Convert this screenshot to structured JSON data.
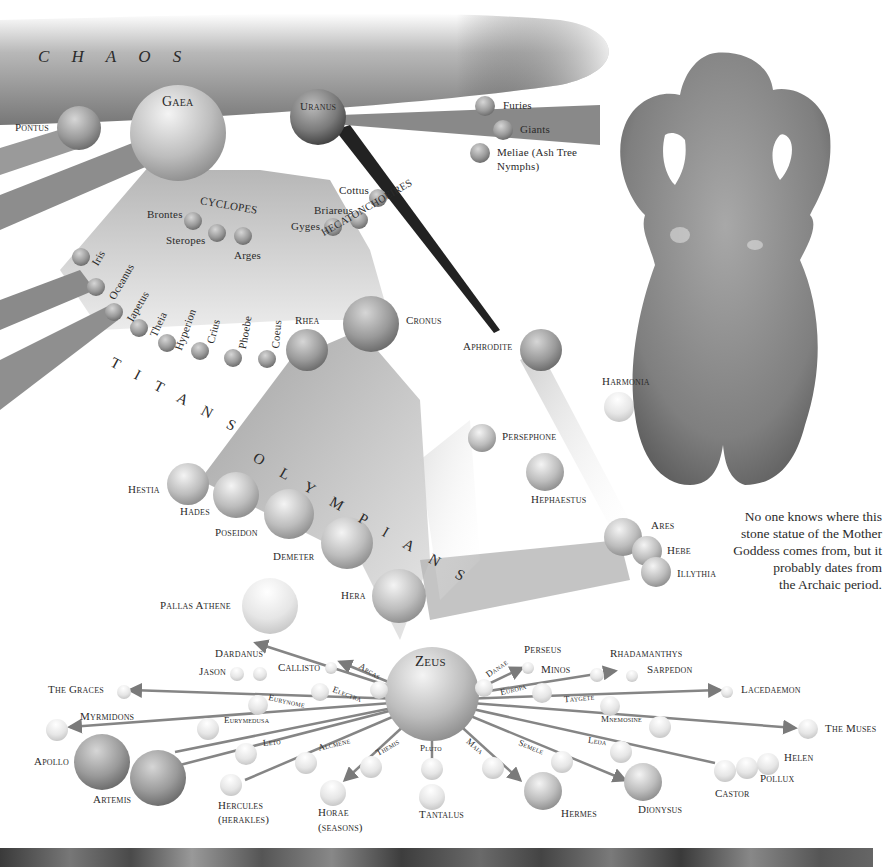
{
  "diagram": {
    "groups": {
      "chaos": "C   H   A   O   S",
      "cyclopes": "CYCLOPES",
      "hecatoncheires": "HECATONCHOEIRES",
      "titans": "T  I  T  A  N  S",
      "olympians": "O  L  Y  M  P  I  A  N  S"
    },
    "primordials": {
      "gaea": "Gaea",
      "uranus": "Uranus",
      "pontus": "Pontus"
    },
    "uranus_children": [
      "Furies",
      "Giants",
      "Meliae (Ash Tree",
      "Nymphs)"
    ],
    "cyclopes": [
      "Brontes",
      "Steropes",
      "Arges"
    ],
    "hecatoncheires": [
      "Cottus",
      "Briareus",
      "Gyges"
    ],
    "titans": [
      "Iris",
      "Oceanus",
      "Iapetus",
      "Theia",
      "Hyperion",
      "Crius",
      "Phoebe",
      "Coeus",
      "Rhea",
      "Cronus"
    ],
    "olympians": [
      "Hestia",
      "Hades",
      "Poseidon",
      "Demeter",
      "Hera",
      "Pallas Athene"
    ],
    "aphrodite_line": [
      "Aphrodite",
      "Harmonia",
      "Persephone",
      "Hephaestus",
      "Ares",
      "Hebe",
      "Illythia"
    ],
    "zeus": "Zeus",
    "consorts": [
      "Arcas",
      "Electra",
      "Eurynome",
      "Eurymedusa",
      "Leto",
      "Alcmene",
      "Themis",
      "Pluto",
      "Maia",
      "Semele",
      "Leda",
      "Mnemosine",
      "Taygete",
      "Europa",
      "Danae"
    ],
    "offspring": {
      "dardanus": "Dardanus",
      "jason": "Jason",
      "callisto": "Callisto",
      "graces": "The Graces",
      "myrmidons": "Myrmidons",
      "apollo": "Apollo",
      "artemis": "Artemis",
      "hercules": "Hercules",
      "hercules2": "(herakles)",
      "horae": "Horae",
      "horae2": "(seasons)",
      "tantalus": "Tantalus",
      "hermes": "Hermes",
      "dionysus": "Dionysus",
      "castor": "Castor",
      "pollux": "Pollux",
      "helen": "Helen",
      "muses": "The Muses",
      "lacedaemon": "Lacedaemon",
      "sarpedon": "Sarpedon",
      "rhadamanthys": "Rhadamanthys",
      "minos": "Minos",
      "perseus": "Perseus"
    }
  },
  "caption": {
    "lines": [
      "No one knows where this",
      "stone statue of the Mother",
      "Goddess comes from, but it",
      "probably dates from",
      "the Archaic period."
    ]
  }
}
